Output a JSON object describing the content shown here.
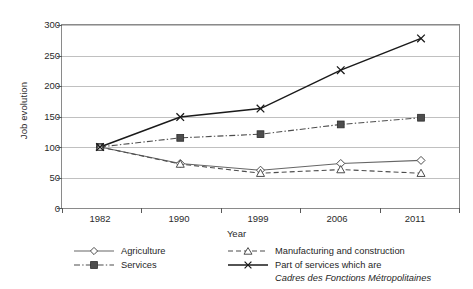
{
  "chart_data": {
    "type": "line",
    "title": "",
    "xlabel": "Year",
    "ylabel": "Job evolution",
    "categories": [
      "1982",
      "1990",
      "1999",
      "2006",
      "2011"
    ],
    "ylim": [
      0,
      300
    ],
    "yticks": [
      0,
      50,
      100,
      150,
      200,
      250,
      300
    ],
    "grid": "horizontal",
    "legend_position": "bottom",
    "series": [
      {
        "name": "Agriculture",
        "values": [
          100,
          73,
          62,
          73,
          78
        ],
        "marker": "open-diamond",
        "line": "solid",
        "color": "#666666"
      },
      {
        "name": "Services",
        "values": [
          100,
          115,
          121,
          137,
          148
        ],
        "marker": "filled-square",
        "line": "dash-dot",
        "color": "#4d4d4d"
      },
      {
        "name": "Manufacturing and construction",
        "values": [
          100,
          72,
          57,
          63,
          57
        ],
        "marker": "open-triangle",
        "line": "dashed",
        "color": "#4d4d4d"
      },
      {
        "name": "Part of services which are Cadres des Fonctions Métropolitaines",
        "values": [
          100,
          149,
          163,
          226,
          278
        ],
        "marker": "cross-x",
        "line": "solid",
        "color": "#1a1a1a"
      }
    ]
  },
  "axes": {
    "ylabel": "Job evolution",
    "xlabel": "Year",
    "ytick_labels": [
      "300",
      "250",
      "200",
      "150",
      "100",
      "50",
      "0"
    ],
    "xtick_labels": [
      "1982",
      "1990",
      "1999",
      "2006",
      "2011"
    ]
  },
  "legend": {
    "items": [
      {
        "label": "Agriculture",
        "icon": "open-diamond-marker-icon"
      },
      {
        "label": "Services",
        "icon": "filled-square-marker-icon"
      },
      {
        "label": "Manufacturing and construction",
        "icon": "open-triangle-marker-icon"
      },
      {
        "label": "Part of services which are",
        "icon": "cross-x-marker-icon"
      }
    ],
    "italic_continuation": "Cadres des Fonctions Métropolitaines"
  },
  "colors": {
    "axis": "#5a5a5a",
    "grid": "#b0b0b0",
    "text": "#231f20",
    "series_dark": "#1a1a1a",
    "series_mid": "#4d4d4d",
    "series_light": "#666666"
  }
}
